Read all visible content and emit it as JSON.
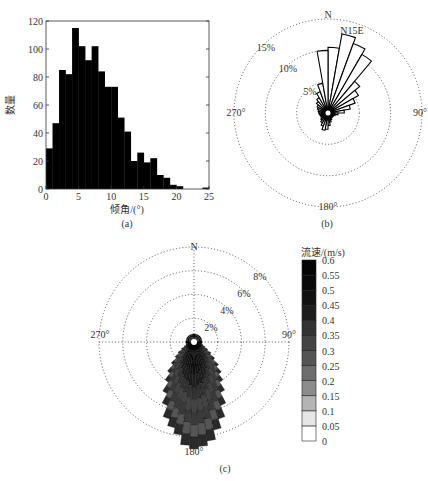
{
  "chart_data": [
    {
      "id": "a",
      "type": "bar",
      "title": "",
      "caption": "(a)",
      "xlabel": "倾角/(°)",
      "ylabel": "数量",
      "xlim": [
        0,
        25
      ],
      "ylim": [
        0,
        120
      ],
      "xticks": [
        0,
        5,
        10,
        15,
        20,
        25
      ],
      "yticks": [
        0,
        20,
        40,
        60,
        80,
        100,
        120
      ],
      "bin_width": 1,
      "categories": [
        "0-1",
        "1-2",
        "2-3",
        "3-4",
        "4-5",
        "5-6",
        "6-7",
        "7-8",
        "8-9",
        "9-10",
        "10-11",
        "11-12",
        "12-13",
        "13-14",
        "14-15",
        "15-16",
        "16-17",
        "17-18",
        "18-19",
        "19-20",
        "20-21",
        "21-22",
        "22-23",
        "23-24",
        "24-25"
      ],
      "values": [
        29,
        47,
        85,
        82,
        115,
        102,
        92,
        102,
        84,
        73,
        73,
        51,
        41,
        20,
        26,
        19,
        22,
        10,
        8,
        3,
        2,
        0,
        0,
        0,
        1
      ],
      "bar_color": "#000000",
      "grid": false
    },
    {
      "id": "b",
      "type": "rose",
      "caption": "(b)",
      "annotation": "N15E",
      "direction_labels": {
        "north": "N",
        "east": "90°",
        "south": "180°",
        "west": "270°"
      },
      "ring_labels": [
        "5%",
        "10%",
        "15%"
      ],
      "rings": [
        5,
        10,
        15
      ],
      "bin_deg": 10,
      "bin_starts_deg": [
        0,
        10,
        20,
        30,
        40,
        50,
        60,
        70,
        80,
        90,
        100,
        110,
        120,
        130,
        140,
        150,
        160,
        170,
        180,
        190,
        200,
        210,
        220,
        230,
        240,
        250,
        260,
        270,
        280,
        290,
        300,
        310,
        320,
        330,
        340,
        350
      ],
      "values_pct": [
        10.5,
        12.8,
        11.8,
        10.8,
        6.6,
        5.6,
        4.6,
        3.6,
        2.6,
        1.6,
        1.2,
        1.0,
        0.9,
        0.9,
        1.0,
        1.2,
        1.5,
        2.0,
        2.6,
        2.8,
        2.2,
        1.8,
        1.5,
        1.3,
        1.2,
        1.3,
        1.4,
        1.5,
        1.6,
        1.8,
        2.0,
        2.4,
        2.8,
        3.6,
        4.8,
        10.0
      ],
      "fill": "#ffffff",
      "stroke": "#000000"
    },
    {
      "id": "c",
      "type": "rose_stacked",
      "caption": "(c)",
      "direction_labels": {
        "north": "N",
        "east": "90°",
        "south": "180°",
        "west": "270°"
      },
      "ring_labels": [
        "2%",
        "4%",
        "6%",
        "8%"
      ],
      "rings": [
        2,
        4,
        6,
        8
      ],
      "bin_deg": 5,
      "bin_centers_deg": [
        100,
        105,
        110,
        115,
        120,
        125,
        130,
        135,
        140,
        145,
        150,
        155,
        160,
        165,
        170,
        175,
        180,
        185,
        190,
        195,
        200,
        205,
        210,
        215,
        220,
        225,
        230,
        235,
        240,
        245,
        250,
        255,
        260
      ],
      "values_pct": [
        0.4,
        0.6,
        0.8,
        1.0,
        1.3,
        1.7,
        2.2,
        2.8,
        3.4,
        4.0,
        4.8,
        5.8,
        6.8,
        7.6,
        8.4,
        8.8,
        9.0,
        8.7,
        7.9,
        7.4,
        6.8,
        5.8,
        4.9,
        4.0,
        3.3,
        2.6,
        2.0,
        1.6,
        1.2,
        0.9,
        0.7,
        0.5,
        0.4
      ],
      "north_cap_pct": 0.7,
      "colorbar": {
        "title": "流速/(m/s)",
        "ticks": [
          "0.6",
          "0.55",
          "0.5",
          "0.45",
          "0.4",
          "0.35",
          "0.3",
          "0.25",
          "0.2",
          "0.15",
          "0.1",
          "0.05",
          "0"
        ],
        "bins": [
          {
            "from": 0.0,
            "to": 0.05,
            "color": "#ffffff"
          },
          {
            "from": 0.05,
            "to": 0.1,
            "color": "#e6e6e6"
          },
          {
            "from": 0.1,
            "to": 0.15,
            "color": "#b4b4b4"
          },
          {
            "from": 0.15,
            "to": 0.2,
            "color": "#8c8c8c"
          },
          {
            "from": 0.2,
            "to": 0.25,
            "color": "#6e6e6e"
          },
          {
            "from": 0.25,
            "to": 0.3,
            "color": "#555555"
          },
          {
            "from": 0.3,
            "to": 0.35,
            "color": "#444444"
          },
          {
            "from": 0.35,
            "to": 0.4,
            "color": "#333333"
          },
          {
            "from": 0.4,
            "to": 0.45,
            "color": "#1e1e1e"
          },
          {
            "from": 0.45,
            "to": 0.5,
            "color": "#121212"
          },
          {
            "from": 0.5,
            "to": 0.55,
            "color": "#0a0a0a"
          },
          {
            "from": 0.55,
            "to": 0.6,
            "color": "#050505"
          }
        ]
      }
    }
  ]
}
